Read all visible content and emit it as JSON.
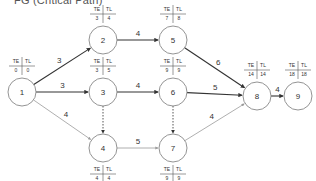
{
  "title": "FG (Critical Path)",
  "colors": {
    "critical_edge": "#333333",
    "normal_edge": "#9a9a9a",
    "dummy_edge": "#555555",
    "node_stroke": "#888888"
  },
  "table_headers": {
    "te": "TE",
    "tl": "TL"
  },
  "nodes": [
    {
      "id": "1",
      "x": 22,
      "y": 92,
      "te": "0",
      "tl": "0",
      "table_pos": "above"
    },
    {
      "id": "2",
      "x": 103,
      "y": 40,
      "te": "3",
      "tl": "4",
      "table_pos": "above"
    },
    {
      "id": "3",
      "x": 103,
      "y": 92,
      "te": "3",
      "tl": "5",
      "table_pos": "above"
    },
    {
      "id": "4",
      "x": 103,
      "y": 148,
      "te": "4",
      "tl": "4",
      "table_pos": "below"
    },
    {
      "id": "5",
      "x": 173,
      "y": 40,
      "te": "7",
      "tl": "8",
      "table_pos": "above"
    },
    {
      "id": "6",
      "x": 173,
      "y": 92,
      "te": "9",
      "tl": "9",
      "table_pos": "above"
    },
    {
      "id": "7",
      "x": 173,
      "y": 148,
      "te": "9",
      "tl": "9",
      "table_pos": "below"
    },
    {
      "id": "8",
      "x": 257,
      "y": 96,
      "te": "14",
      "tl": "14",
      "table_pos": "above"
    },
    {
      "id": "9",
      "x": 298,
      "y": 96,
      "te": "18",
      "tl": "18",
      "table_pos": "above"
    }
  ],
  "edges": [
    {
      "from": "1",
      "to": "2",
      "weight": "3",
      "type": "critical"
    },
    {
      "from": "1",
      "to": "3",
      "weight": "3",
      "type": "critical"
    },
    {
      "from": "1",
      "to": "4",
      "weight": "4",
      "type": "normal"
    },
    {
      "from": "2",
      "to": "5",
      "weight": "4",
      "type": "critical"
    },
    {
      "from": "3",
      "to": "6",
      "weight": "4",
      "type": "critical"
    },
    {
      "from": "3",
      "to": "4",
      "weight": "",
      "type": "dummy"
    },
    {
      "from": "4",
      "to": "7",
      "weight": "5",
      "type": "normal"
    },
    {
      "from": "5",
      "to": "8",
      "weight": "6",
      "type": "critical"
    },
    {
      "from": "6",
      "to": "8",
      "weight": "5",
      "type": "critical"
    },
    {
      "from": "6",
      "to": "7",
      "weight": "",
      "type": "dummy"
    },
    {
      "from": "7",
      "to": "8",
      "weight": "4",
      "type": "normal"
    },
    {
      "from": "8",
      "to": "9",
      "weight": "4",
      "type": "critical"
    }
  ]
}
